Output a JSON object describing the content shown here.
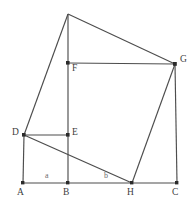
{
  "figure": {
    "width": 196,
    "height": 210,
    "background_color": "#ffffff",
    "stroke_color": "#4d4d4d",
    "vertex_color": "#2b2b2b",
    "label_color": "#3d3d3d",
    "segment_label_color": "#6e6e6e"
  },
  "points": {
    "A": {
      "label": "A",
      "x": 23,
      "y": 183,
      "label_x": 17,
      "label_y": 190
    },
    "B": {
      "label": "B",
      "x": 68,
      "y": 183,
      "label_x": 63,
      "label_y": 190
    },
    "H": {
      "label": "H",
      "x": 132,
      "y": 183,
      "label_x": 127,
      "label_y": 190
    },
    "C": {
      "label": "C",
      "x": 177,
      "y": 183,
      "label_x": 172,
      "label_y": 190
    },
    "D": {
      "label": "D",
      "x": 24,
      "y": 135,
      "label_x": 13,
      "label_y": 130
    },
    "E": {
      "label": "E",
      "x": 68,
      "y": 135,
      "label_x": 72,
      "label_y": 130
    },
    "F": {
      "label": "F",
      "x": 68,
      "y": 63,
      "label_x": 72,
      "label_y": 65
    },
    "G": {
      "label": "G",
      "x": 175,
      "y": 64,
      "label_x": 180,
      "label_y": 57
    },
    "T": {
      "label": "",
      "x": 68,
      "y": 14,
      "label_x": 0,
      "label_y": 0
    }
  },
  "segment_labels": [
    {
      "name": "segment-a",
      "text": "a",
      "x": 45,
      "y": 173
    },
    {
      "name": "segment-b",
      "text": "b",
      "x": 104,
      "y": 173
    }
  ],
  "edges": [
    {
      "name": "edge-A-B",
      "from": "A",
      "to": "B"
    },
    {
      "name": "edge-B-H",
      "from": "B",
      "to": "H"
    },
    {
      "name": "edge-H-C",
      "from": "H",
      "to": "C"
    },
    {
      "name": "edge-A-D",
      "from": "A",
      "to": "D"
    },
    {
      "name": "edge-D-E",
      "from": "D",
      "to": "E"
    },
    {
      "name": "edge-D-T",
      "from": "D",
      "to": "T"
    },
    {
      "name": "edge-T-G",
      "from": "T",
      "to": "G"
    },
    {
      "name": "edge-T-B",
      "from": "T",
      "to": "B"
    },
    {
      "name": "edge-F-G",
      "from": "F",
      "to": "G"
    },
    {
      "name": "edge-G-C",
      "from": "G",
      "to": "C"
    },
    {
      "name": "edge-G-H",
      "from": "G",
      "to": "H"
    },
    {
      "name": "edge-D-H",
      "from": "D",
      "to": "H"
    }
  ]
}
